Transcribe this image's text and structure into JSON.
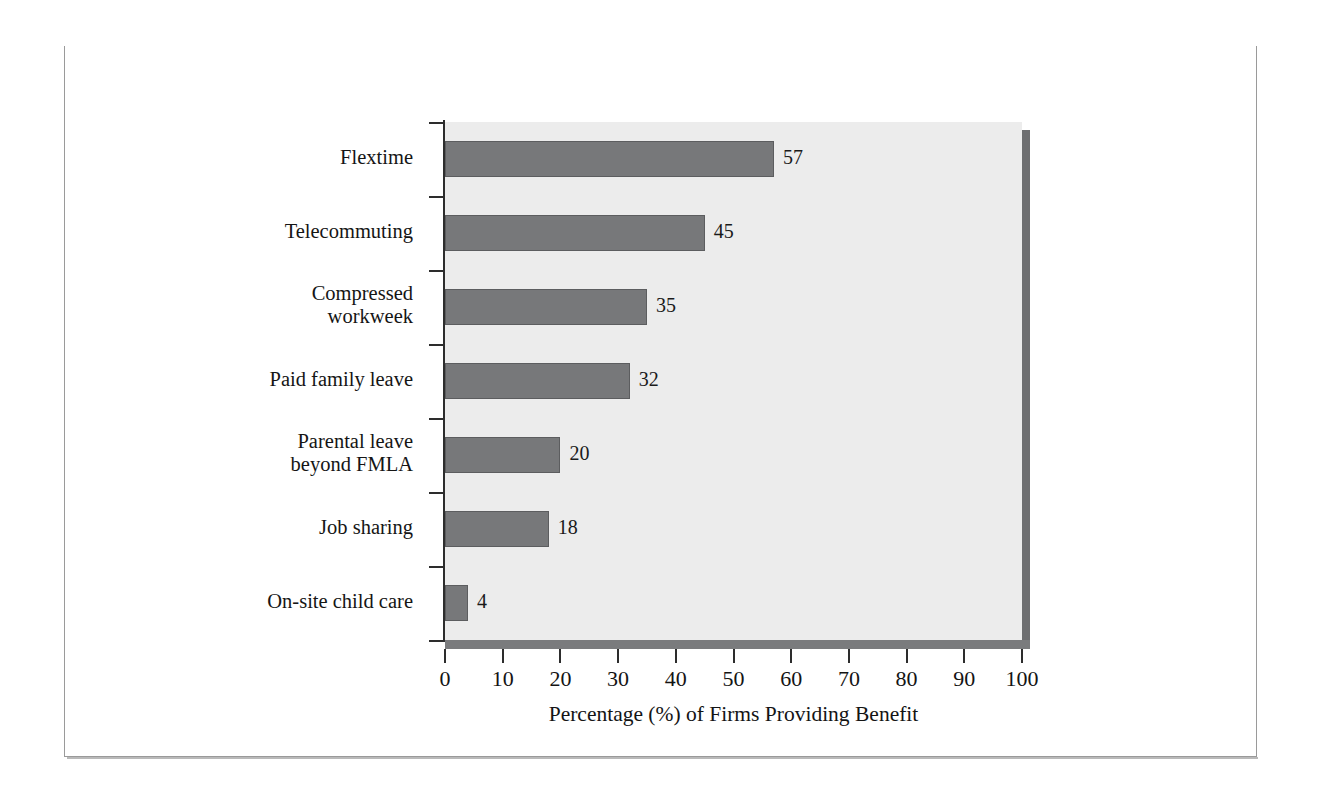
{
  "exhibit": {
    "label": "EXHIBIT 12.13",
    "title": "Prevalence of Work/Life Benefits and Services"
  },
  "colors": {
    "titlebar_bg": "#3c3c3c",
    "titlebar_text": "#ffffff",
    "plot_bg": "#ececec",
    "bar_fill": "#77787a",
    "bar_stroke": "#5c5d5f",
    "axis": "#2d2d2d",
    "shadow": "#6e6f71",
    "frame_border": "#9a9a9a"
  },
  "chart_data": {
    "type": "bar",
    "orientation": "horizontal",
    "title": "Prevalence of Work/Life Benefits and Services",
    "subtitle": "",
    "categories": [
      "Flextime",
      "Telecommuting",
      "Compressed\nworkweek",
      "Paid family leave",
      "Parental leave\nbeyond FMLA",
      "Job sharing",
      "On-site child care"
    ],
    "values": [
      57,
      45,
      35,
      32,
      20,
      18,
      4
    ],
    "value_labels": [
      "57",
      "45",
      "35",
      "32",
      "20",
      "18",
      "4"
    ],
    "xlabel": "Percentage (%) of Firms Providing Benefit",
    "ylabel": "",
    "xlim": [
      0,
      100
    ],
    "xticks": [
      0,
      10,
      20,
      30,
      40,
      50,
      60,
      70,
      80,
      90,
      100
    ],
    "xtick_labels": [
      "0",
      "10",
      "20",
      "30",
      "40",
      "50",
      "60",
      "70",
      "80",
      "90",
      "100"
    ],
    "grid": false,
    "legend": null
  }
}
